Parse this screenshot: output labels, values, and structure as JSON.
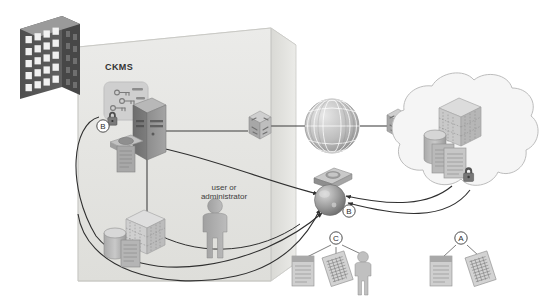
{
  "diagram": {
    "type": "network-architecture",
    "title_label": "CKMS",
    "enclosure": {
      "name": "organization-boundary",
      "fill": "#e8e8e6",
      "stroke": "#c6c6c2"
    },
    "labels": {
      "ckms": "CKMS",
      "user_or_administrator": "user or\nadministrator"
    },
    "markers": [
      {
        "id": "marker-b-ckms",
        "letter": "B",
        "x": 103,
        "y": 126
      },
      {
        "id": "marker-b-sphere",
        "letter": "B",
        "x": 349,
        "y": 213
      },
      {
        "id": "marker-c-group",
        "letter": "C",
        "x": 336,
        "y": 238
      },
      {
        "id": "marker-a-group",
        "letter": "A",
        "x": 461,
        "y": 238
      }
    ],
    "nodes": [
      {
        "id": "office-building",
        "label": "building",
        "x": 14,
        "y": 18
      },
      {
        "id": "ckms-key-store",
        "label": "key management application",
        "x": 104,
        "y": 83
      },
      {
        "id": "ckms-server-tower",
        "label": "server tower",
        "x": 133,
        "y": 112
      },
      {
        "id": "ckms-database-docs",
        "label": "database and documents",
        "x": 110,
        "y": 140
      },
      {
        "id": "ckms-padlock",
        "label": "padlock",
        "x": 112,
        "y": 112
      },
      {
        "id": "storage-cube",
        "label": "storage cube",
        "x": 126,
        "y": 212
      },
      {
        "id": "storage-cylinder",
        "label": "database cylinder",
        "x": 108,
        "y": 234
      },
      {
        "id": "storage-document",
        "label": "document",
        "x": 126,
        "y": 243
      },
      {
        "id": "user-person",
        "label": "user or administrator",
        "x": 210,
        "y": 203
      },
      {
        "id": "router-left",
        "label": "router",
        "x": 250,
        "y": 110
      },
      {
        "id": "internet-globe",
        "label": "internet",
        "x": 315,
        "y": 100
      },
      {
        "id": "router-right",
        "label": "router",
        "x": 385,
        "y": 108
      },
      {
        "id": "cloud",
        "label": "cloud network",
        "x": 405,
        "y": 88
      },
      {
        "id": "cloud-server",
        "label": "cloud server",
        "x": 447,
        "y": 108
      },
      {
        "id": "cloud-cylinder",
        "label": "cloud database",
        "x": 432,
        "y": 140
      },
      {
        "id": "cloud-documents",
        "label": "protected documents",
        "x": 438,
        "y": 152
      },
      {
        "id": "cloud-padlock",
        "label": "padlock",
        "x": 466,
        "y": 168
      },
      {
        "id": "handheld-device",
        "label": "handheld device",
        "x": 316,
        "y": 170
      },
      {
        "id": "key-sphere",
        "label": "cryptographic key",
        "x": 324,
        "y": 188
      },
      {
        "id": "doc-c-plain",
        "label": "plaintext document",
        "x": 296,
        "y": 255
      },
      {
        "id": "doc-c-cipher",
        "label": "encrypted document",
        "x": 320,
        "y": 258
      },
      {
        "id": "person-c",
        "label": "person",
        "x": 358,
        "y": 252
      },
      {
        "id": "doc-a-plain",
        "label": "plaintext document",
        "x": 435,
        "y": 255
      },
      {
        "id": "doc-a-cipher",
        "label": "encrypted document",
        "x": 463,
        "y": 258
      }
    ],
    "colors": {
      "enclosure_fill": "#e9e9e7",
      "enclosure_stroke": "#c4c4c0",
      "building_dark": "#6e6e6e",
      "building_window": "#f2f2f2",
      "device_gray": "#9a9a9a",
      "device_light": "#c2c2c2",
      "device_dark": "#707070",
      "line": "#3c3c3c",
      "text": "#3a3a3a",
      "cloud_fill": "#f3f3f3",
      "cloud_stroke": "#bdbdbd"
    }
  }
}
